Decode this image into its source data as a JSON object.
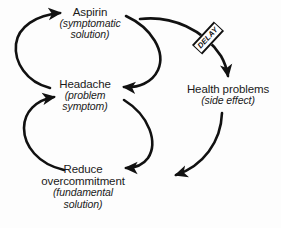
{
  "diagram": {
    "type": "causal-loop-diagram",
    "background_color": "#fdfdfd",
    "stroke_color": "#111111",
    "text_color": "#1a1a1a"
  },
  "nodes": [
    {
      "id": "aspirin",
      "title": "Aspirin",
      "sub_line1": "(symptomatic",
      "sub_line2": "solution)",
      "role": "symptomatic solution"
    },
    {
      "id": "headache",
      "title": "Headache",
      "sub_line1": "(problem",
      "sub_line2": "symptom)",
      "role": "problem symptom"
    },
    {
      "id": "reduce",
      "title_line1": "Reduce",
      "title_line2": "overcommitment",
      "sub_line1": "(fundamental",
      "sub_line2": "solution)",
      "role": "fundamental solution"
    },
    {
      "id": "health",
      "title": "Health problems",
      "sub_line1": "(side effect)",
      "role": "side effect"
    }
  ],
  "markers": [
    {
      "id": "delay",
      "label": "DELAY",
      "on_link": "aspirin-to-health-problems",
      "rotation_deg": -47
    }
  ],
  "links": [
    {
      "id": "headache-to-aspirin",
      "from": "headache",
      "to": "aspirin",
      "shape": "curve-left"
    },
    {
      "id": "aspirin-to-headache",
      "from": "aspirin",
      "to": "headache",
      "shape": "curve-right"
    },
    {
      "id": "aspirin-to-health",
      "from": "aspirin",
      "to": "health",
      "shape": "curve-right-down",
      "delay": true
    },
    {
      "id": "health-to-reduce",
      "from": "health",
      "to": "reduce",
      "shape": "curve-down-left"
    },
    {
      "id": "headache-to-reduce",
      "from": "headache",
      "to": "reduce",
      "shape": "curve-right-down"
    },
    {
      "id": "reduce-to-headache",
      "from": "reduce",
      "to": "headache",
      "shape": "curve-left"
    }
  ]
}
